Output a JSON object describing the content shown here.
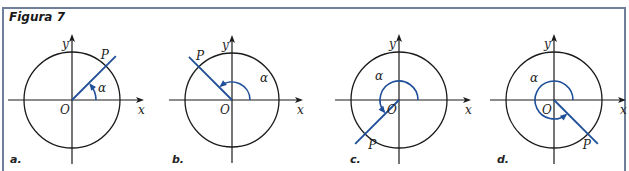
{
  "figure": {
    "title": "Figura 7",
    "frame_color": "#6f7f99",
    "ray_color": "#1f4f99",
    "axis_color": "#1a1a1a"
  },
  "panels": [
    {
      "label": "a.",
      "origin": [
        72,
        100
      ],
      "radius": 48,
      "angle_deg": 45,
      "arc_radius": 24,
      "axis_x": "x",
      "axis_y": "y",
      "origin_label": "O",
      "point_label": "P",
      "angle_label": "α"
    },
    {
      "label": "b.",
      "origin": [
        232,
        100
      ],
      "radius": 47,
      "angle_deg": 135,
      "arc_radius": 18,
      "axis_x": "x",
      "axis_y": "y",
      "origin_label": "O",
      "point_label": "P",
      "angle_label": "α"
    },
    {
      "label": "c.",
      "origin": [
        399,
        100
      ],
      "radius": 48,
      "angle_deg": 225,
      "arc_radius": 19,
      "axis_x": "x",
      "axis_y": "y",
      "origin_label": "O",
      "point_label": "P",
      "angle_label": "α"
    },
    {
      "label": "d.",
      "origin": [
        554,
        100
      ],
      "radius": 48,
      "angle_deg": 315,
      "arc_radius": 19,
      "axis_x": "x",
      "axis_y": "y",
      "origin_label": "O",
      "point_label": "P",
      "angle_label": "α"
    }
  ]
}
